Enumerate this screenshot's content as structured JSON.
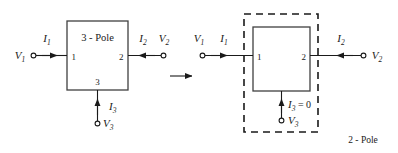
{
  "figure": {
    "implication_arrow": "right-arrow"
  },
  "colors": {
    "line": "#1a1a1a",
    "box_outline": "#404040",
    "background": "#ffffff"
  },
  "left_network": {
    "box_label": "3 - Pole",
    "port_numbers": {
      "port1": "1",
      "port2": "2",
      "port3": "3"
    },
    "voltages": {
      "v1": {
        "symbol": "V",
        "subscript": "1"
      },
      "v2": {
        "symbol": "V",
        "subscript": "2"
      },
      "v3": {
        "symbol": "V",
        "subscript": "3"
      }
    },
    "currents": {
      "i1": {
        "symbol": "I",
        "subscript": "1",
        "direction": "into-network-right"
      },
      "i2": {
        "symbol": "I",
        "subscript": "2",
        "direction": "into-network-left"
      },
      "i3": {
        "symbol": "I",
        "subscript": "3",
        "direction": "into-network-up"
      }
    }
  },
  "right_network": {
    "enclosure_label": "2 - Pole",
    "port_numbers": {
      "port1": "1",
      "port2": "2"
    },
    "voltages": {
      "v1": {
        "symbol": "V",
        "subscript": "1"
      },
      "v2": {
        "symbol": "V",
        "subscript": "2"
      },
      "v3": {
        "symbol": "V",
        "subscript": "3"
      }
    },
    "currents": {
      "i1": {
        "symbol": "I",
        "subscript": "1",
        "direction": "into-network-right"
      },
      "i2": {
        "symbol": "I",
        "subscript": "2",
        "direction": "into-network-left"
      },
      "i3": {
        "symbol": "I",
        "subscript": "3",
        "direction": "into-network-up",
        "value_text": "= 0"
      }
    }
  }
}
